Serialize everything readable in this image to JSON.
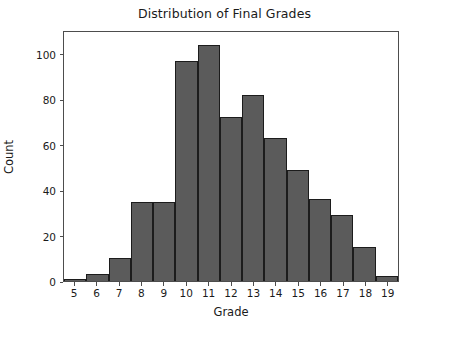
{
  "chart_data": {
    "type": "bar",
    "title": "Distribution of Final Grades",
    "xlabel": "Grade",
    "ylabel": "Count",
    "categories": [
      5,
      6,
      7,
      8,
      9,
      10,
      11,
      12,
      13,
      14,
      15,
      16,
      17,
      18,
      19
    ],
    "values": [
      1,
      3,
      10,
      35,
      35,
      97,
      104,
      72,
      82,
      63,
      49,
      36,
      29,
      15,
      2
    ],
    "xtick_labels": [
      "5",
      "6",
      "7",
      "8",
      "9",
      "10",
      "11",
      "12",
      "13",
      "14",
      "15",
      "16",
      "17",
      "18",
      "19"
    ],
    "ytick_labels": [
      "0",
      "20",
      "40",
      "60",
      "80",
      "100"
    ],
    "ytick_values": [
      0,
      20,
      40,
      60,
      80,
      100
    ],
    "ylim": [
      0,
      110.5
    ],
    "xlim": [
      4.5,
      19.5
    ],
    "grid": false,
    "legend": null,
    "bar_color": "#5b5b5b",
    "bar_edge_color": "#1c1c1c",
    "axes_color": "#4d4d4d",
    "text_color": "#1a1a1a",
    "background": "#ffffff"
  }
}
